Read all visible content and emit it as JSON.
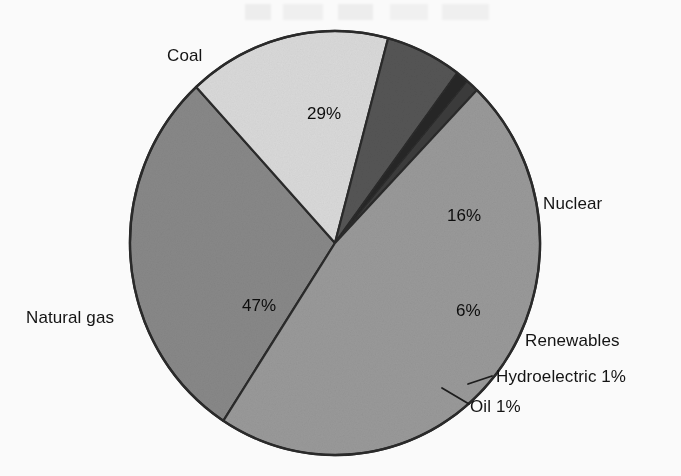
{
  "chart_data": {
    "type": "pie",
    "title": "",
    "subtitle": "",
    "xlabel": "",
    "ylabel": "",
    "legend_position": "none",
    "grid": false,
    "units": "percent",
    "categories": [
      "Coal",
      "Nuclear",
      "Renewables",
      "Hydroelectric",
      "Oil",
      "Natural gas"
    ],
    "values": [
      29,
      16,
      6,
      1,
      1,
      47
    ],
    "labels": [
      "29%",
      "16%",
      "6%",
      "Hydroelectric 1%",
      "Oil 1%",
      "47%"
    ],
    "slices": [
      {
        "name": "Coal",
        "value": 29,
        "value_label": "29%",
        "category_label": "Coal",
        "color": "#8a8a8a",
        "label_placement": "outside-top-left",
        "value_placement": "inside"
      },
      {
        "name": "Nuclear",
        "value": 16,
        "value_label": "16%",
        "category_label": "Nuclear",
        "color": "#dcdcdc",
        "label_placement": "outside-right",
        "value_placement": "inside"
      },
      {
        "name": "Renewables",
        "value": 6,
        "value_label": "6%",
        "category_label": "Renewables",
        "color": "#565656",
        "label_placement": "outside-right",
        "value_placement": "inside"
      },
      {
        "name": "Hydroelectric",
        "value": 1,
        "value_label": "1%",
        "category_label": "Hydroelectric 1%",
        "color": "#262626",
        "label_placement": "outside-right-leader",
        "value_placement": "outside"
      },
      {
        "name": "Oil",
        "value": 1,
        "value_label": "1%",
        "category_label": "Oil 1%",
        "color": "#3c3c3c",
        "label_placement": "outside-right-leader",
        "value_placement": "outside"
      },
      {
        "name": "Natural gas",
        "value": 47,
        "value_label": "47%",
        "category_label": "Natural gas",
        "color": "#9b9b9b",
        "label_placement": "outside-left",
        "value_placement": "inside"
      }
    ],
    "outline_color": "#2b2b2b",
    "background": "#fdfdfd"
  },
  "chart": {
    "labels": {
      "coal": "Coal",
      "nuclear": "Nuclear",
      "renewables": "Renewables",
      "hydroelectric": "Hydroelectric 1%",
      "oil": "Oil 1%",
      "natural_gas": "Natural gas"
    },
    "percentages": {
      "coal": "29%",
      "nuclear": "16%",
      "renewables": "6%",
      "natural_gas": "47%"
    }
  }
}
